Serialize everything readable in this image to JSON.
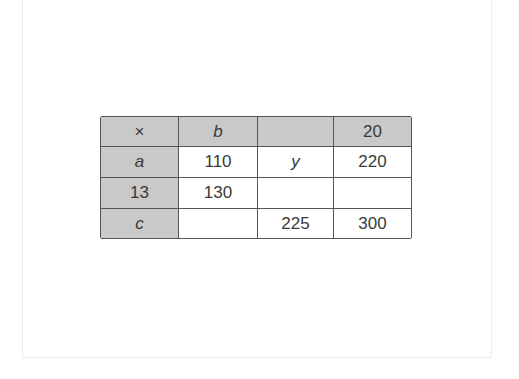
{
  "table": {
    "fill_color": "#c9c9c9",
    "border_color": "#555555",
    "text_color": "#3a3a3a",
    "header": [
      "×",
      "b",
      "",
      "20"
    ],
    "rows": [
      [
        "a",
        "110",
        "y",
        "220"
      ],
      [
        "13",
        "130",
        "",
        ""
      ],
      [
        "c",
        "",
        "225",
        "300"
      ]
    ]
  }
}
